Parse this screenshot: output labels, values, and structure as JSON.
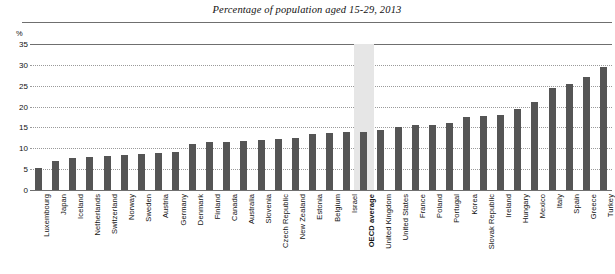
{
  "chart_data": {
    "type": "bar",
    "title": "Percentage of population aged 15-29, 2013",
    "xlabel": "",
    "ylabel": "%",
    "ylim": [
      0,
      35
    ],
    "yticks": [
      0,
      5,
      10,
      15,
      20,
      25,
      30,
      35
    ],
    "grid": true,
    "legend": "none",
    "highlight_category": "OECD average",
    "bar_color": "#555555",
    "highlight_band_color": "#e6e6e6",
    "categories": [
      "Luxembourg",
      "Japan",
      "Iceland",
      "Netherlands",
      "Switzerland",
      "Norway",
      "Sweden",
      "Austria",
      "Germany",
      "Denmark",
      "Finland",
      "Canada",
      "Australia",
      "Slovenia",
      "Czech Republic",
      "New Zealand",
      "Estonia",
      "Belgium",
      "Israel",
      "OECD average",
      "United Kingdom",
      "United States",
      "France",
      "Poland",
      "Portugal",
      "Korea",
      "Slovak Republic",
      "Ireland",
      "Hungary",
      "Mexico",
      "Italy",
      "Spain",
      "Greece",
      "Turkey"
    ],
    "values": [
      5.3,
      6.9,
      7.6,
      8.0,
      8.2,
      8.4,
      8.6,
      8.8,
      9.0,
      11.0,
      11.4,
      11.6,
      11.8,
      12.0,
      12.2,
      12.4,
      13.5,
      13.7,
      13.9,
      14.0,
      14.5,
      15.0,
      15.5,
      15.7,
      16.0,
      17.5,
      17.7,
      18.0,
      19.5,
      21.0,
      24.5,
      25.5,
      27.0,
      29.5
    ]
  }
}
